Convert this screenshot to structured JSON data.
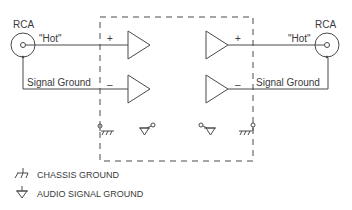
{
  "diagram": {
    "left_connector": {
      "label": "RCA",
      "hot_label": "\"Hot\"",
      "ground_label": "Signal Ground"
    },
    "right_connector": {
      "label": "RCA",
      "hot_label": "\"Hot\"",
      "ground_label": "Signal Ground"
    },
    "input_amp": {
      "plus": "+",
      "minus": "–"
    },
    "output_amp": {
      "plus": "+",
      "minus": "–"
    },
    "legend": [
      {
        "icon": "chassis-ground-icon",
        "label": "CHASSIS GROUND"
      },
      {
        "icon": "audio-signal-ground-icon",
        "label": "AUDIO SIGNAL GROUND"
      }
    ],
    "colors": {
      "line": "#4a4a4a",
      "text": "#3a3a3a",
      "background": "#ffffff"
    }
  }
}
